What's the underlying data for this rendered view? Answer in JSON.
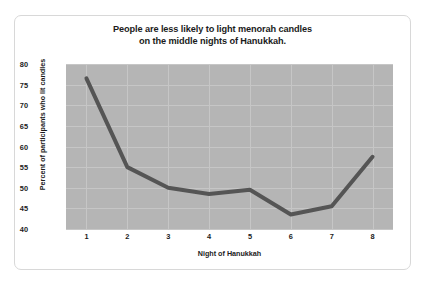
{
  "chart_data": {
    "type": "line",
    "title": "People are less likely to light menorah candles on the middle nights of Hanukkah.",
    "title_lines": [
      "People are less likely to light menorah candles",
      "on the middle nights of Hanukkah."
    ],
    "xlabel": "Night of Hanukkah",
    "ylabel": "Percent of participants who lit candles",
    "categories": [
      "1",
      "2",
      "3",
      "4",
      "5",
      "6",
      "7",
      "8"
    ],
    "x": [
      1,
      2,
      3,
      4,
      5,
      6,
      7,
      8
    ],
    "values": [
      76.5,
      55.0,
      50.0,
      48.5,
      49.5,
      43.5,
      45.5,
      57.5
    ],
    "ylim": [
      40,
      80
    ],
    "xlim": [
      0.5,
      8.5
    ],
    "yticks": [
      40,
      45,
      50,
      55,
      60,
      65,
      70,
      75,
      80
    ],
    "xticks": [
      "1",
      "2",
      "3",
      "4",
      "5",
      "6",
      "7",
      "8"
    ],
    "grid": true,
    "legend": false,
    "series": [
      {
        "name": "Percent of participants who lit candles",
        "values": [
          76.5,
          55.0,
          50.0,
          48.5,
          49.5,
          43.5,
          45.5,
          57.5
        ]
      }
    ],
    "colors": {
      "line": "#555555",
      "plot_background": "#b5b5b5",
      "gridline": "#c6c6c6",
      "text": "#1b1b1b",
      "card_background": "#ffffff",
      "card_border": "#d8d8d8"
    },
    "line_width": 4
  }
}
